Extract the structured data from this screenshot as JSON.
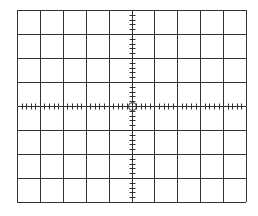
{
  "graticule": {
    "left": 17,
    "top": 10,
    "width": 229,
    "height": 192,
    "columns": 10,
    "rows": 8,
    "minor_divisions_per_cell": 5,
    "tick_length": 6,
    "line_color": "#333333",
    "tick_color": "#333333",
    "background": "#ffffff",
    "center_marker": {
      "shape": "circle",
      "radius": 4
    }
  }
}
